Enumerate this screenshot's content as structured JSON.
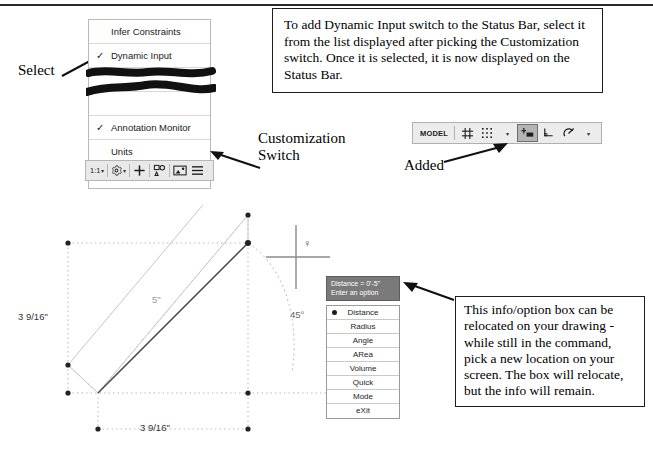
{
  "annotations": {
    "select": "Select",
    "customization_switch": "Customization\nSwitch",
    "customization_switch_line1": "Customization",
    "customization_switch_line2": "Switch",
    "added": "Added"
  },
  "note_top": {
    "text": "To add Dynamic Input switch to the Status Bar, select it from the list displayed after picking the Customization switch.  Once it is selected, it is now displayed on the Status Bar."
  },
  "note_bottom": {
    "text": "This info/option box can be relocated on your drawing - while still in the command, pick a new location on your screen. The box will relocate, but the info will remain."
  },
  "customization_menu": {
    "items": [
      {
        "label": "Infer Constraints",
        "checked": false,
        "obscured": false
      },
      {
        "label": "Dynamic Input",
        "checked": true,
        "obscured": false
      },
      {
        "label": "",
        "checked": false,
        "obscured": true
      },
      {
        "label": "",
        "checked": false,
        "obscured": true
      },
      {
        "label": "Annotation Monitor",
        "checked": true,
        "obscured": false
      },
      {
        "label": "Units",
        "checked": false,
        "obscured": false
      },
      {
        "label": "Quick Properties",
        "checked": false,
        "obscured": false
      }
    ],
    "check_glyph": "✓"
  },
  "status_strip": {
    "scale_label": "1:1",
    "caret": "▾",
    "items": [
      {
        "name": "annotation-scale",
        "label": "1:1",
        "caret": true
      },
      {
        "name": "annotation-visibility-gear",
        "label": "⚙",
        "caret": true
      },
      {
        "name": "add-scales-plus",
        "label": "+",
        "caret": false
      },
      {
        "name": "isolate-objects",
        "label": "",
        "caret": false
      },
      {
        "name": "clean-screen",
        "label": "",
        "caret": false
      },
      {
        "name": "customization-hamburger",
        "label": "☰",
        "caret": false
      }
    ]
  },
  "model_bar": {
    "model_label": "MODEL",
    "caret": "▾",
    "buttons": [
      {
        "name": "grid-display-button",
        "active": false
      },
      {
        "name": "snap-mode-button",
        "active": false
      },
      {
        "name": "snap-dropdown-caret",
        "active": false
      },
      {
        "name": "dynamic-input-button",
        "active": true
      },
      {
        "name": "ortho-mode-button",
        "active": false
      },
      {
        "name": "polar-tracking-button",
        "active": false
      },
      {
        "name": "polar-dropdown-caret",
        "active": false
      }
    ]
  },
  "info_box": {
    "heading_line1": "Distance = 0'-5\"",
    "heading_line2": "Enter an option",
    "options": [
      {
        "label": "Distance",
        "selected": true
      },
      {
        "label": "Radius",
        "selected": false
      },
      {
        "label": "Angle",
        "selected": false
      },
      {
        "label": "ARea",
        "selected": false
      },
      {
        "label": "Volume",
        "selected": false
      },
      {
        "label": "Quick",
        "selected": false
      },
      {
        "label": "Mode",
        "selected": false
      },
      {
        "label": "eXit",
        "selected": false
      }
    ]
  },
  "drawing": {
    "dimensions": {
      "vertical_left": "3 9/16\"",
      "horizontal_bottom": "3 9/16\"",
      "line_length": "5\"",
      "angle": "45°"
    },
    "cursor_glyph": "♀"
  },
  "colors": {
    "menu_border": "#b9b9b9",
    "strip_bg": "#e9e9e9",
    "info_head_bg": "#7a7a7a",
    "active_button_bg": "#b4b4b4",
    "drawing_line": "#555555",
    "construction_line": "#bdbdbd",
    "text": "#000000"
  }
}
